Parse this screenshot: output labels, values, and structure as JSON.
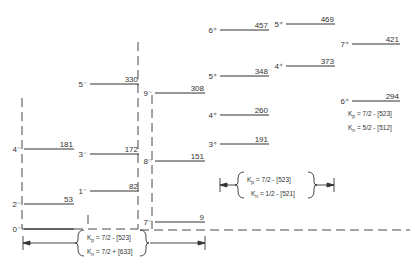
{
  "colors": {
    "line": "#333333",
    "text": "#333333",
    "background": "#ffffff"
  },
  "bands": [
    {
      "name": "band-4minus",
      "levels": [
        {
          "spin": "0⁻",
          "energy": "",
          "x1": 24,
          "x2": 74,
          "y": 229
        },
        {
          "spin": "2⁻",
          "energy": "53",
          "x1": 24,
          "x2": 74,
          "y": 204
        },
        {
          "spin": "4⁻",
          "energy": "181",
          "x1": 24,
          "x2": 74,
          "y": 149
        }
      ]
    },
    {
      "name": "band-5minus",
      "levels": [
        {
          "spin": "1⁻",
          "energy": "82",
          "x1": 90,
          "x2": 139,
          "y": 191
        },
        {
          "spin": "3⁻",
          "energy": "172",
          "x1": 90,
          "x2": 139,
          "y": 154
        },
        {
          "spin": "5⁻",
          "energy": "330",
          "x1": 90,
          "x2": 139,
          "y": 84
        }
      ]
    },
    {
      "name": "band-7minus",
      "levels": [
        {
          "spin": "7⁻",
          "energy": "9",
          "x1": 155,
          "x2": 205,
          "y": 222
        },
        {
          "spin": "8⁻",
          "energy": "151",
          "x1": 155,
          "x2": 205,
          "y": 161
        },
        {
          "spin": "9⁻",
          "energy": "308",
          "x1": 155,
          "x2": 205,
          "y": 93
        }
      ]
    },
    {
      "name": "band-3plus",
      "levels": [
        {
          "spin": "3⁺",
          "energy": "191",
          "x1": 220,
          "x2": 269,
          "y": 144
        },
        {
          "spin": "4⁺",
          "energy": "260",
          "x1": 220,
          "x2": 269,
          "y": 115
        },
        {
          "spin": "5⁺",
          "energy": "348",
          "x1": 220,
          "x2": 269,
          "y": 76
        },
        {
          "spin": "6⁺",
          "energy": "457",
          "x1": 220,
          "x2": 269,
          "y": 30
        }
      ]
    },
    {
      "name": "band-4plus",
      "levels": [
        {
          "spin": "4⁺",
          "energy": "373",
          "x1": 286,
          "x2": 335,
          "y": 66
        },
        {
          "spin": "5⁺",
          "energy": "469",
          "x1": 286,
          "x2": 335,
          "y": 24
        }
      ]
    },
    {
      "name": "band-6plus",
      "levels": [
        {
          "spin": "6⁺",
          "energy": "294",
          "x1": 352,
          "x2": 400,
          "y": 101
        },
        {
          "spin": "7⁺",
          "energy": "421",
          "x1": 352,
          "x2": 400,
          "y": 44
        }
      ]
    }
  ],
  "configs": [
    {
      "kp": "K",
      "kp_sub": "p",
      "kp_val": " = 7/2 - [523]",
      "kn": "K",
      "kn_sub": "n",
      "kn_val": " = 7/2 + [633]"
    },
    {
      "kp": "K",
      "kp_sub": "p",
      "kp_val": " = 7/2 - [523]",
      "kn": "K",
      "kn_sub": "n",
      "kn_val": " = 1/2 - [521]"
    },
    {
      "kp": "K",
      "kp_sub": "p",
      "kp_val": " = 7/2 - [523]",
      "kn": "K",
      "kn_sub": "n",
      "kn_val": " = 5/2 - [512]"
    }
  ]
}
